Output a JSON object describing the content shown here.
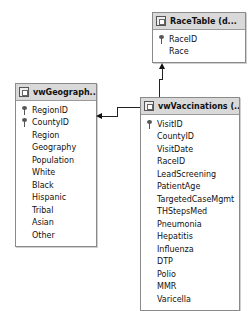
{
  "tables": {
    "race": {
      "title": "RaceTable (d...",
      "columns": [
        {
          "name": "RaceID",
          "key": true
        },
        {
          "name": "Race",
          "key": false
        }
      ]
    },
    "geography": {
      "title": "vwGeograph...",
      "columns": [
        {
          "name": "RegionID",
          "key": true
        },
        {
          "name": "CountyID",
          "key": true
        },
        {
          "name": "Region",
          "key": false
        },
        {
          "name": "Geography",
          "key": false
        },
        {
          "name": "Population",
          "key": false
        },
        {
          "name": "White",
          "key": false
        },
        {
          "name": "Black",
          "key": false
        },
        {
          "name": "Hispanic",
          "key": false
        },
        {
          "name": "Tribal",
          "key": false
        },
        {
          "name": "Asian",
          "key": false
        },
        {
          "name": "Other",
          "key": false
        }
      ]
    },
    "vaccinations": {
      "title": "vwVaccinations (...",
      "columns": [
        {
          "name": "VisitID",
          "key": true
        },
        {
          "name": "CountyID",
          "key": false
        },
        {
          "name": "VisitDate",
          "key": false
        },
        {
          "name": "RaceID",
          "key": false
        },
        {
          "name": "LeadScreening",
          "key": false
        },
        {
          "name": "PatientAge",
          "key": false
        },
        {
          "name": "TargetedCaseMgmt",
          "key": false
        },
        {
          "name": "THStepsMed",
          "key": false
        },
        {
          "name": "Pneumonia",
          "key": false
        },
        {
          "name": "Hepatitis",
          "key": false
        },
        {
          "name": "Influenza",
          "key": false
        },
        {
          "name": "DTP",
          "key": false
        },
        {
          "name": "Polio",
          "key": false
        },
        {
          "name": "MMR",
          "key": false
        },
        {
          "name": "Varicella",
          "key": false
        }
      ]
    }
  },
  "relationships": [
    {
      "from": "vwVaccinations",
      "to": "RaceTable"
    },
    {
      "from": "vwVaccinations",
      "to": "vwGeography"
    }
  ]
}
